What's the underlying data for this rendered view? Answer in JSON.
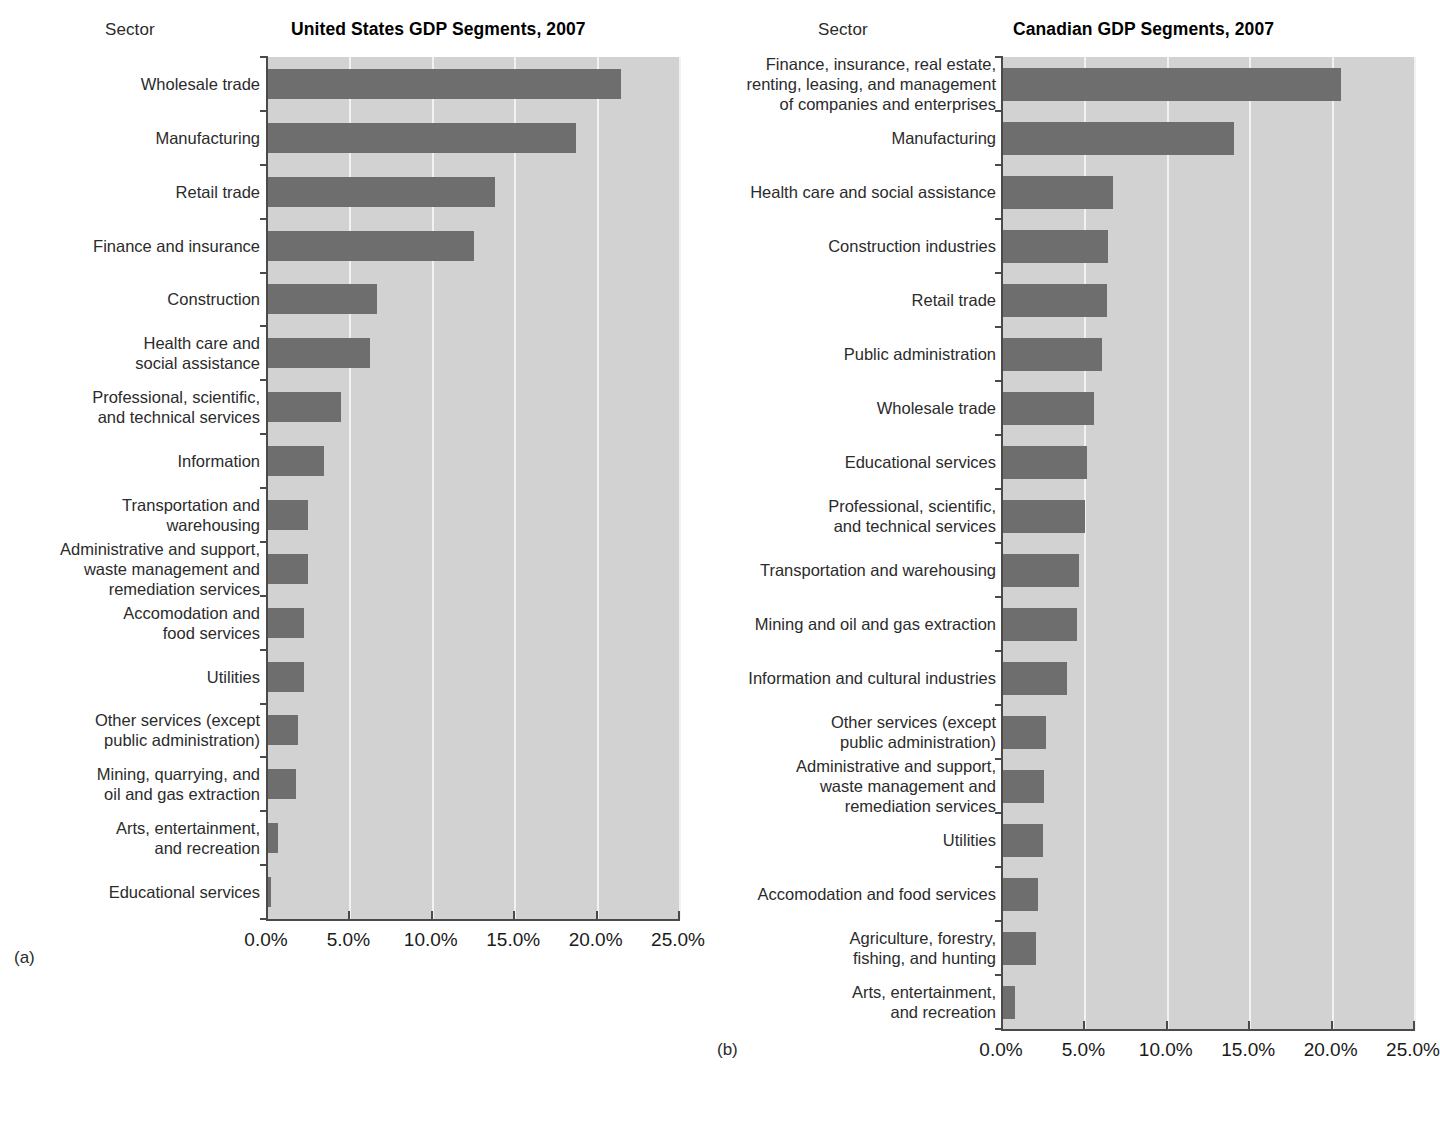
{
  "panels": [
    {
      "letter": "(a)",
      "sector_header": "Sector",
      "title": "United States GDP Segments, 2007"
    },
    {
      "letter": "(b)",
      "sector_header": "Sector",
      "title": "Canadian GDP Segments, 2007"
    }
  ],
  "axis": {
    "ticks": [
      "0.0%",
      "5.0%",
      "10.0%",
      "15.0%",
      "20.0%",
      "25.0%"
    ]
  },
  "colors": {
    "bar": "#6e6e6e",
    "plot_background": "#d2d2d2",
    "gridline": "#f2f2f2",
    "axis": "#4a4a4a",
    "text": "#1a1a1a"
  },
  "chart_data": [
    {
      "type": "bar",
      "orientation": "horizontal",
      "title": "United States GDP Segments, 2007",
      "xlabel": "",
      "ylabel": "Sector",
      "xlim": [
        0,
        25
      ],
      "xticks": [
        0,
        5,
        10,
        15,
        20,
        25
      ],
      "xtick_labels": [
        "0.0%",
        "5.0%",
        "10.0%",
        "15.0%",
        "20.0%",
        "25.0%"
      ],
      "grid": true,
      "legend": "none",
      "units": "percent of GDP",
      "categories": [
        "Wholesale trade",
        "Manufacturing",
        "Retail trade",
        "Finance and insurance",
        "Construction",
        "Health care and\nsocial assistance",
        "Professional, scientific,\nand technical services",
        "Information",
        "Transportation and\nwarehousing",
        "Administrative and support,\nwaste management and\nremediation services",
        "Accomodation and\nfood services",
        "Utilities",
        "Other services (except\npublic administration)",
        "Mining, quarrying, and\noil and gas extraction",
        "Arts, entertainment,\nand recreation",
        "Educational services"
      ],
      "values": [
        21.4,
        18.7,
        13.8,
        12.5,
        6.6,
        6.2,
        4.4,
        3.4,
        2.4,
        2.4,
        2.2,
        2.2,
        1.8,
        1.7,
        0.6,
        0.2
      ]
    },
    {
      "type": "bar",
      "orientation": "horizontal",
      "title": "Canadian GDP Segments, 2007",
      "xlabel": "",
      "ylabel": "Sector",
      "xlim": [
        0,
        25
      ],
      "xticks": [
        0,
        5,
        10,
        15,
        20,
        25
      ],
      "xtick_labels": [
        "0.0%",
        "5.0%",
        "10.0%",
        "15.0%",
        "20.0%",
        "25.0%"
      ],
      "grid": true,
      "legend": "none",
      "units": "percent of GDP",
      "categories": [
        "Finance, insurance, real estate,\nrenting, leasing, and management\nof companies and enterprises",
        "Manufacturing",
        "Health care and social assistance",
        "Construction industries",
        "Retail trade",
        "Public administration",
        "Wholesale trade",
        "Educational services",
        "Professional, scientific,\nand technical services",
        "Transportation and warehousing",
        "Mining and oil and gas extraction",
        "Information and cultural industries",
        "Other services (except\npublic administration)",
        "Administrative and support,\nwaste management and\nremediation services",
        "Utilities",
        "Accomodation and food services",
        "Agriculture, forestry,\nfishing, and hunting",
        "Arts, entertainment,\nand recreation"
      ],
      "values": [
        20.5,
        14.0,
        6.7,
        6.4,
        6.3,
        6.0,
        5.5,
        5.1,
        5.0,
        4.6,
        4.5,
        3.9,
        2.6,
        2.5,
        2.4,
        2.1,
        2.0,
        0.7
      ]
    }
  ]
}
